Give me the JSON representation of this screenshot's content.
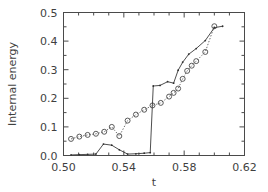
{
  "chart_data": {
    "type": "line",
    "title": "",
    "xlabel": "t",
    "ylabel": "Internal energy",
    "xlim": [
      0.5,
      0.62
    ],
    "ylim": [
      0.0,
      0.5
    ],
    "grid": false,
    "legend": "none",
    "xticks": [
      "0.50",
      "0.54",
      "0.58",
      "0.62"
    ],
    "xtick_values": [
      0.5,
      0.54,
      0.58,
      0.62
    ],
    "yticks": [
      "0.0",
      "0.1",
      "0.2",
      "0.3",
      "0.4",
      "0.5"
    ],
    "ytick_values": [
      0.0,
      0.1,
      0.2,
      0.3,
      0.4,
      0.5
    ],
    "x_minor_per_major": 4,
    "y_minor_per_major": 2,
    "series": [
      {
        "name": "open-circle-dotted-series",
        "marker": "open-circle",
        "linestyle": "dotted",
        "x": [
          0.505,
          0.5105,
          0.516,
          0.5215,
          0.527,
          0.532,
          0.537,
          0.5425,
          0.548,
          0.5535,
          0.559,
          0.5645,
          0.57,
          0.573,
          0.576,
          0.579,
          0.582,
          0.585,
          0.588,
          0.594,
          0.6
        ],
        "y": [
          0.058,
          0.066,
          0.072,
          0.076,
          0.083,
          0.1,
          0.068,
          0.122,
          0.143,
          0.16,
          0.175,
          0.184,
          0.206,
          0.219,
          0.234,
          0.268,
          0.296,
          0.314,
          0.33,
          0.362,
          0.452
        ]
      },
      {
        "name": "solid-line-dot-series",
        "marker": "small-dot",
        "linestyle": "solid",
        "x": [
          0.505,
          0.5105,
          0.516,
          0.5215,
          0.5265,
          0.532,
          0.537,
          0.5425,
          0.548,
          0.5535,
          0.5575,
          0.5595,
          0.564,
          0.569,
          0.573,
          0.576,
          0.579,
          0.583,
          0.588,
          0.594,
          0.6,
          0.6055
        ],
        "y": [
          0.002,
          0.003,
          0.004,
          0.005,
          0.04,
          0.036,
          0.02,
          0.005,
          0.006,
          0.008,
          0.01,
          0.243,
          0.245,
          0.258,
          0.253,
          0.298,
          0.326,
          0.354,
          0.374,
          0.402,
          0.447,
          0.452
        ]
      }
    ]
  },
  "figure": {
    "background_color": "#ffffff",
    "axis_color": "#4a4a4a",
    "series_color": "#4a4a4a"
  }
}
